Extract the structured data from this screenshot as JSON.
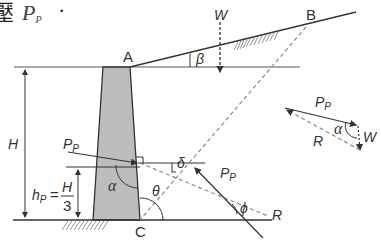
{
  "heading": {
    "prefix_char": "壓",
    "symbol": "P",
    "symbol_sub": "P",
    "suffix": "·"
  },
  "points": {
    "A": "A",
    "B": "B",
    "C": "C"
  },
  "labels": {
    "weight": "W",
    "beta": "β",
    "height": "H",
    "hp_main": "h",
    "hp_sub": "P",
    "hp_eq": "=",
    "hp_num": "H",
    "hp_den": "3",
    "pp_left": "P",
    "pp_left_sub": "P",
    "pp_right": "P",
    "pp_right_sub": "P",
    "alpha": "α",
    "theta": "θ",
    "delta": "δ",
    "phi": "ϕ",
    "reaction": "R"
  },
  "force_triangle": {
    "pp": "P",
    "pp_sub": "P",
    "alpha": "α",
    "weight": "W",
    "reaction": "R"
  },
  "colors": {
    "line": "#333333",
    "wall_fill": "#bdbdbd",
    "dashed": "#8a8a8a"
  }
}
